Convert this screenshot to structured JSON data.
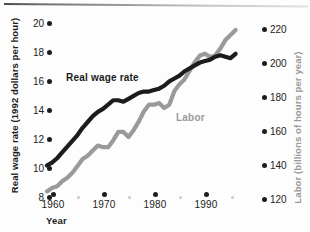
{
  "chart": {
    "x_axis_title": "Year",
    "y_left_title": "Real wage rate (1992 dollars per hour)",
    "y_right_title": "Labor (billions of hours per year)",
    "series_label_wage": "Real wage rate",
    "series_label_labor": "Labor",
    "x_ticks": [
      "1960",
      "1970",
      "1980",
      "1990"
    ],
    "y_left_ticks": [
      "20",
      "18",
      "16",
      "14",
      "12",
      "10",
      "8"
    ],
    "y_right_ticks": [
      "220",
      "200",
      "180",
      "160",
      "140",
      "120"
    ],
    "color_wage": "#1c1c1c",
    "color_labor": "#9a9a9a"
  },
  "chart_data": {
    "type": "line",
    "title": "",
    "xlabel": "Year",
    "ylabel": "Real wage rate (1992 dollars per hour)",
    "y2label": "Labor (billions of hours per year)",
    "xlim": [
      1959,
      1997
    ],
    "ylim": [
      8,
      20
    ],
    "y2lim": [
      120,
      220
    ],
    "xticks": [
      1960,
      1970,
      1980,
      1990
    ],
    "yticks": [
      8,
      10,
      12,
      14,
      16,
      18,
      20
    ],
    "y2ticks": [
      120,
      140,
      160,
      180,
      200,
      220
    ],
    "grid": false,
    "legend": "inline-annotations",
    "series": [
      {
        "name": "Real wage rate",
        "axis": "left",
        "units": "1992 dollars per hour",
        "color": "#1c1c1c",
        "x": [
          1959,
          1960,
          1961,
          1962,
          1963,
          1964,
          1965,
          1966,
          1967,
          1968,
          1969,
          1970,
          1971,
          1972,
          1973,
          1974,
          1975,
          1976,
          1977,
          1978,
          1979,
          1980,
          1981,
          1982,
          1983,
          1984,
          1985,
          1986,
          1987,
          1988,
          1989,
          1990,
          1991,
          1992,
          1993,
          1994,
          1995,
          1996
        ],
        "values": [
          10.0,
          10.2,
          10.5,
          10.9,
          11.3,
          11.7,
          12.1,
          12.6,
          13.0,
          13.4,
          13.7,
          13.9,
          14.2,
          14.5,
          14.5,
          14.4,
          14.6,
          14.8,
          15.0,
          15.1,
          15.1,
          15.2,
          15.3,
          15.5,
          15.8,
          16.0,
          16.2,
          16.5,
          16.7,
          16.9,
          17.1,
          17.2,
          17.3,
          17.5,
          17.6,
          17.5,
          17.4,
          17.7
        ]
      },
      {
        "name": "Labor",
        "axis": "right",
        "units": "billions of hours per year",
        "color": "#9a9a9a",
        "x": [
          1959,
          1960,
          1961,
          1962,
          1963,
          1964,
          1965,
          1966,
          1967,
          1968,
          1969,
          1970,
          1971,
          1972,
          1973,
          1974,
          1975,
          1976,
          1977,
          1978,
          1979,
          1980,
          1981,
          1982,
          1983,
          1984,
          1985,
          1986,
          1987,
          1988,
          1989,
          1990,
          1991,
          1992,
          1993,
          1994,
          1995,
          1996
        ],
        "values": [
          123,
          125,
          126,
          129,
          131,
          134,
          138,
          142,
          144,
          147,
          150,
          149,
          149,
          153,
          158,
          158,
          155,
          159,
          164,
          170,
          174,
          174,
          175,
          172,
          174,
          182,
          186,
          189,
          194,
          199,
          203,
          204,
          202,
          203,
          207,
          212,
          215,
          218
        ]
      }
    ],
    "annotations": [
      {
        "text": "Real wage rate",
        "series": "Real wage rate"
      },
      {
        "text": "Labor",
        "series": "Labor"
      }
    ]
  }
}
